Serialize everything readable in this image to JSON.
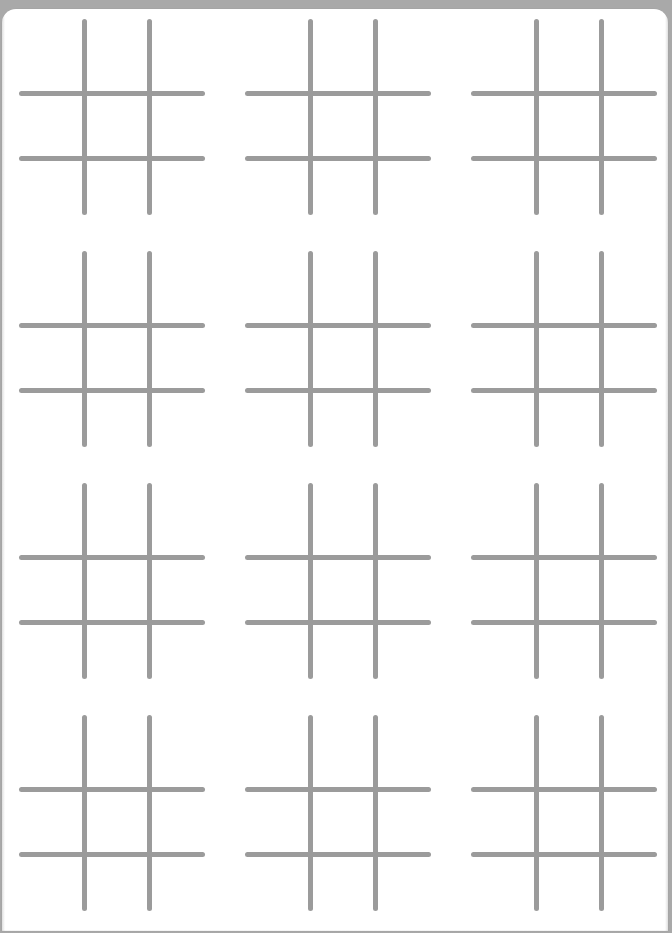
{
  "page": {
    "kind": "printable-worksheet",
    "background_color": "#a9a9a9",
    "sheet_color": "#ffffff",
    "sheet_corner_radius_px": 14
  },
  "grid_style": {
    "line_color": "#9b9b9b",
    "line_thickness_px": 5,
    "line_cap": "rounded",
    "cell_size_px": 65
  },
  "layout": {
    "rows": 4,
    "columns": 3,
    "board_count": 12,
    "row_pitch_px": 232,
    "column_pitch_px": 226
  },
  "boards": [
    {
      "id": "board-r1c1",
      "row": 1,
      "column": 1,
      "x": 19,
      "y": 19,
      "width": 186,
      "height": 196,
      "marks": []
    },
    {
      "id": "board-r1c2",
      "row": 1,
      "column": 2,
      "x": 245,
      "y": 19,
      "width": 186,
      "height": 196,
      "marks": []
    },
    {
      "id": "board-r1c3",
      "row": 1,
      "column": 3,
      "x": 471,
      "y": 19,
      "width": 186,
      "height": 196,
      "marks": []
    },
    {
      "id": "board-r2c1",
      "row": 2,
      "column": 1,
      "x": 19,
      "y": 251,
      "width": 186,
      "height": 196,
      "marks": []
    },
    {
      "id": "board-r2c2",
      "row": 2,
      "column": 2,
      "x": 245,
      "y": 251,
      "width": 186,
      "height": 196,
      "marks": []
    },
    {
      "id": "board-r2c3",
      "row": 2,
      "column": 3,
      "x": 471,
      "y": 251,
      "width": 186,
      "height": 196,
      "marks": []
    },
    {
      "id": "board-r3c1",
      "row": 3,
      "column": 1,
      "x": 19,
      "y": 483,
      "width": 186,
      "height": 196,
      "marks": []
    },
    {
      "id": "board-r3c2",
      "row": 3,
      "column": 2,
      "x": 245,
      "y": 483,
      "width": 186,
      "height": 196,
      "marks": []
    },
    {
      "id": "board-r3c3",
      "row": 3,
      "column": 3,
      "x": 471,
      "y": 483,
      "width": 186,
      "height": 196,
      "marks": []
    },
    {
      "id": "board-r4c1",
      "row": 4,
      "column": 1,
      "x": 19,
      "y": 715,
      "width": 186,
      "height": 196,
      "marks": []
    },
    {
      "id": "board-r4c2",
      "row": 4,
      "column": 2,
      "x": 245,
      "y": 715,
      "width": 186,
      "height": 196,
      "marks": []
    },
    {
      "id": "board-r4c3",
      "row": 4,
      "column": 3,
      "x": 471,
      "y": 715,
      "width": 186,
      "height": 196,
      "marks": []
    }
  ]
}
